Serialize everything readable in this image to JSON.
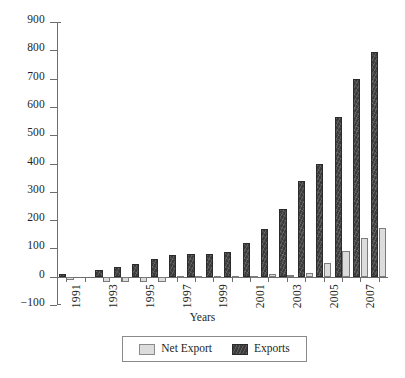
{
  "chart_data": {
    "type": "bar",
    "title": "",
    "xlabel": "Years",
    "ylabel": "",
    "ylim": [
      -100,
      900
    ],
    "yticks": [
      900,
      800,
      700,
      600,
      500,
      400,
      300,
      200,
      100,
      0,
      -100
    ],
    "grid": false,
    "legend_position": "bottom",
    "categories": [
      "1991",
      "1992",
      "1993",
      "1994",
      "1995",
      "1996",
      "1997",
      "1998",
      "1999",
      "2000",
      "2001",
      "2002",
      "2003",
      "2004",
      "2005",
      "2006",
      "2007",
      "2008"
    ],
    "tick_labels_shown": [
      "1991",
      "",
      "1993",
      "",
      "1995",
      "",
      "1997",
      "",
      "1999",
      "",
      "2001",
      "",
      "2003",
      "",
      "2005",
      "",
      "2007",
      ""
    ],
    "series": [
      {
        "name": "Net Export",
        "color": "#dcdcdc",
        "values": [
          -11,
          0,
          -17,
          -20,
          -19,
          -18,
          -5,
          2,
          2,
          2,
          1,
          8,
          5,
          12,
          48,
          92,
          136,
          172
        ]
      },
      {
        "name": "Exports",
        "color": "#3b3b3b",
        "values": [
          9,
          0,
          23,
          34,
          46,
          61,
          76,
          80,
          81,
          89,
          120,
          169,
          240,
          338,
          399,
          564,
          697,
          795
        ]
      }
    ]
  },
  "legend": {
    "entries": [
      {
        "label": "Net Export",
        "swatch": "light-gray-square"
      },
      {
        "label": "Exports",
        "swatch": "dark-square"
      }
    ]
  }
}
